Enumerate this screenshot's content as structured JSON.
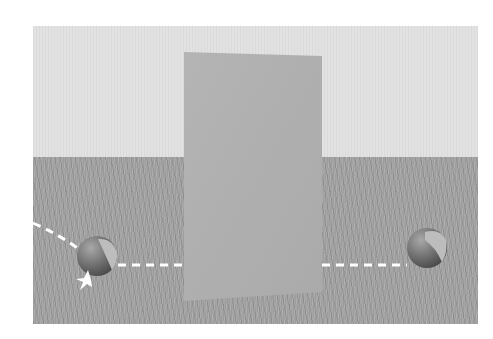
{
  "scene": {
    "description": "Two balls on a wooden floor separated by a vertical panel; dashed trajectory lines",
    "colors": {
      "wall": "#e2e2e2",
      "floor": "#a5a5a5",
      "panel": "#b0b0b0",
      "ball_dark": "#6e6e6e",
      "ball_light": "#bdbdbd",
      "trajectory": "#ffffff"
    },
    "panel": {
      "corners": [
        [
          184,
          52
        ],
        [
          322,
          56
        ],
        [
          322,
          292
        ],
        [
          184,
          301
        ]
      ]
    },
    "left_ball": {
      "cx": 97,
      "cy": 256,
      "r": 20,
      "has_impact_burst": true
    },
    "right_ball": {
      "cx": 427,
      "cy": 248,
      "r": 20,
      "has_impact_burst": false
    },
    "trajectories": [
      {
        "name": "incoming-curve",
        "points": [
          [
            33,
            223
          ],
          [
            60,
            237
          ],
          [
            80,
            250
          ]
        ]
      },
      {
        "name": "left-horizontal",
        "points": [
          [
            118,
            265
          ],
          [
            182,
            265
          ]
        ]
      },
      {
        "name": "right-horizontal",
        "points": [
          [
            322,
            265
          ],
          [
            407,
            265
          ]
        ]
      }
    ]
  }
}
